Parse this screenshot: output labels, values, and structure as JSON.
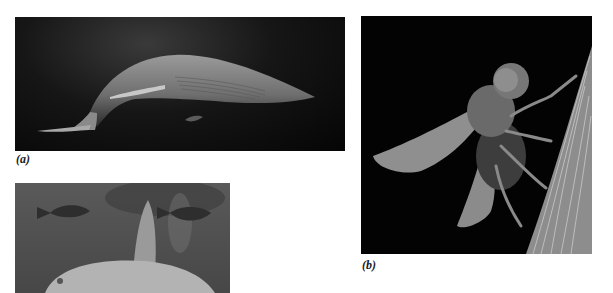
{
  "figure": {
    "panels": [
      {
        "id": "a",
        "caption": "(a)",
        "subject": "whale swimming in dark ocean",
        "icon": "whale-image"
      },
      {
        "id": "b",
        "caption": "(b)",
        "subject": "fly perched on grass blade (micrograph)",
        "icon": "fly-image"
      },
      {
        "id": "c",
        "caption": "",
        "subject": "sunfish with two small fish",
        "icon": "sunfish-image"
      }
    ]
  }
}
